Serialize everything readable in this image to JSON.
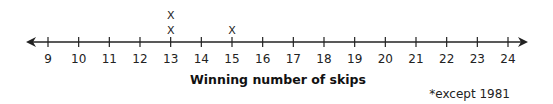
{
  "chart_data": {
    "type": "dot-plot",
    "title": "",
    "xlabel": "Winning number of skips",
    "ylabel": "",
    "xlim": [
      9,
      24
    ],
    "ticks": [
      9,
      10,
      11,
      12,
      13,
      14,
      15,
      16,
      17,
      18,
      19,
      20,
      21,
      22,
      23,
      24
    ],
    "tick_labels": [
      "9",
      "10",
      "11",
      "12",
      "13",
      "14",
      "15",
      "16",
      "17",
      "18",
      "19",
      "20",
      "21",
      "22",
      "23",
      "24"
    ],
    "points": [
      {
        "x": 13,
        "count": 2
      },
      {
        "x": 15,
        "count": 1
      }
    ],
    "marker": "X",
    "annotation": "*except 1981",
    "grid": false,
    "arrows": "both-ends"
  }
}
